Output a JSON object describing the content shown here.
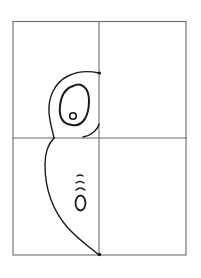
{
  "figure": {
    "colors": {
      "grid": "#6b6b6b",
      "ink": "#1a1a1a",
      "background": "#ffffff"
    },
    "grid": {
      "columns": 2,
      "rows": 2
    },
    "drawing": {
      "subject": "half owl (left half)",
      "parts": [
        "head",
        "eye-outer",
        "eye-pupil",
        "body",
        "feather-marks",
        "belly-spot",
        "top-dot",
        "bottom-dot"
      ]
    }
  }
}
